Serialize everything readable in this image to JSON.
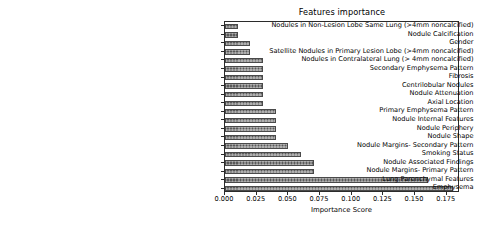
{
  "chart_data": {
    "type": "bar",
    "orientation": "horizontal",
    "title": "Features importance",
    "xlabel": "Importance Score",
    "ylabel": "",
    "grid": false,
    "legend": null,
    "xlim": [
      0.0,
      0.1855
    ],
    "xticks": [
      0.0,
      0.025,
      0.05,
      0.075,
      0.1,
      0.125,
      0.15,
      0.175
    ],
    "xtick_labels": [
      "0.000",
      "0.025",
      "0.050",
      "0.075",
      "0.100",
      "0.125",
      "0.150",
      "0.175"
    ],
    "bar_color": "#5a5a5a",
    "bar_hatch": "crosshatch",
    "categories": [
      "Nodules in Non-Lesion Lobe Same Lung (>4mm noncalcified)",
      "Nodule Calcification",
      "Gender",
      "Satellite Nodules in Primary Lesion Lobe (>4mm noncalcified)",
      "Nodules in Contralateral Lung (> 4mm noncalcified)",
      "Secondary Emphysema Pattern",
      "Fibrosis",
      "Centrilobular Nodules",
      "Nodule Attenuation",
      "Axial Location",
      "Primary Emphysema Pattern",
      "Nodule Internal Features",
      "Nodule Periphery",
      "Nodule Shape",
      "Nodule Margins- Secondary Pattern",
      "Smoking Status",
      "Nodule Associated Findings",
      "Nodule Margins- Primary Pattern",
      "Lung Parenchymal Features",
      "Emphysema"
    ],
    "values": [
      0.01,
      0.01,
      0.02,
      0.02,
      0.03,
      0.03,
      0.03,
      0.03,
      0.03,
      0.03,
      0.04,
      0.04,
      0.04,
      0.04,
      0.05,
      0.06,
      0.07,
      0.07,
      0.16,
      0.18
    ]
  }
}
